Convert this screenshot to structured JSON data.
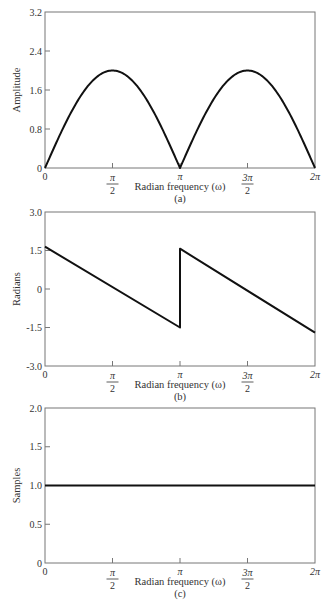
{
  "chart_data": [
    {
      "id": "a",
      "type": "line",
      "caption": "(a)",
      "title": "",
      "xlabel": "Radian frequency (ω)",
      "ylabel": "Amplitude",
      "xlim": [
        0,
        6.2832
      ],
      "ylim": [
        0,
        3.2
      ],
      "yticks": [
        "0",
        "0.8",
        "1.6",
        "2.4",
        "3.2"
      ],
      "ytick_values": [
        0,
        0.8,
        1.6,
        2.4,
        3.2
      ],
      "xticks": [
        {
          "num": "0",
          "den": ""
        },
        {
          "num": "π",
          "den": "2"
        },
        {
          "num": "π",
          "den": ""
        },
        {
          "num": "3π",
          "den": "2"
        },
        {
          "num": "2π",
          "den": ""
        }
      ],
      "xtick_values": [
        0,
        1.5708,
        3.1416,
        4.7124,
        6.2832
      ],
      "grid": false,
      "series": [
        {
          "name": "magnitude",
          "description": "|2 sin(ω)|, zeros at 0, π, 2π; peaks of 2.0 at π/2 and 3π/2",
          "x": [
            0,
            0.3927,
            0.7854,
            1.1781,
            1.5708,
            1.9635,
            2.3562,
            2.7489,
            3.1416,
            3.5343,
            3.927,
            4.3197,
            4.7124,
            5.1051,
            5.4978,
            5.8905,
            6.2832
          ],
          "y": [
            0,
            0.765,
            1.414,
            1.848,
            2.0,
            1.848,
            1.414,
            0.765,
            0,
            0.765,
            1.414,
            1.848,
            2.0,
            1.848,
            1.414,
            0.765,
            0
          ]
        }
      ]
    },
    {
      "id": "b",
      "type": "line",
      "caption": "(b)",
      "title": "",
      "xlabel": "Radian frequency (ω)",
      "ylabel": "Radians",
      "xlim": [
        0,
        6.2832
      ],
      "ylim": [
        -3.0,
        3.0
      ],
      "yticks": [
        "-3.0",
        "-1.5",
        "0",
        "1.5",
        "3.0"
      ],
      "ytick_values": [
        -3.0,
        -1.5,
        0,
        1.5,
        3.0
      ],
      "xticks": [
        {
          "num": "0",
          "den": ""
        },
        {
          "num": "π",
          "den": "2"
        },
        {
          "num": "π",
          "den": ""
        },
        {
          "num": "3π",
          "den": "2"
        },
        {
          "num": "2π",
          "den": ""
        }
      ],
      "xtick_values": [
        0,
        1.5708,
        3.1416,
        4.7124,
        6.2832
      ],
      "grid": false,
      "series": [
        {
          "name": "phase",
          "description": "Linear phase with slope -1, jump of +π at ω=π",
          "x": [
            0,
            3.1416,
            3.1416,
            6.2832
          ],
          "y": [
            1.65,
            -1.5,
            1.57,
            -1.7
          ]
        }
      ]
    },
    {
      "id": "c",
      "type": "line",
      "caption": "(c)",
      "title": "",
      "xlabel": "Radian frequency (ω)",
      "ylabel": "Samples",
      "xlim": [
        0,
        6.2832
      ],
      "ylim": [
        0,
        2.0
      ],
      "yticks": [
        "0",
        "0.5",
        "1.0",
        "1.5",
        "2.0"
      ],
      "ytick_values": [
        0,
        0.5,
        1.0,
        1.5,
        2.0
      ],
      "xticks": [
        {
          "num": "0",
          "den": ""
        },
        {
          "num": "π",
          "den": "2"
        },
        {
          "num": "π",
          "den": ""
        },
        {
          "num": "3π",
          "den": "2"
        },
        {
          "num": "2π",
          "den": ""
        }
      ],
      "xtick_values": [
        0,
        1.5708,
        3.1416,
        4.7124,
        6.2832
      ],
      "grid": false,
      "series": [
        {
          "name": "group-delay",
          "description": "Constant group delay of 1.0 sample",
          "x": [
            0,
            6.2832
          ],
          "y": [
            1.0,
            1.0
          ]
        }
      ]
    }
  ]
}
